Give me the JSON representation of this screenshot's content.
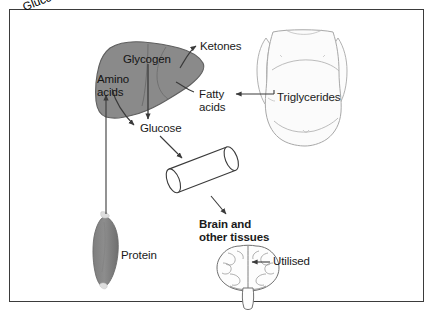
{
  "diagram": {
    "background": "#ffffff",
    "border_color": "#3b3b3b",
    "organ_fill": "#8a8a8a",
    "organ_stroke": "#5a5a5a",
    "outline_color": "#9a9a9a",
    "arrow_color": "#3a3a3a",
    "text_color": "#1a1a1a"
  },
  "labels": {
    "glycogen": "Glycogen",
    "amino_acids": "Amino\nacids",
    "ketones": "Ketones",
    "fatty_acids": "Fatty\nacids",
    "triglycerides": "Triglycerides",
    "glucose_liver": "Glucose",
    "glucose_tube": "Glucose",
    "brain_and_other_tissues": "Brain and\nother tissues",
    "utilised": "Utilised",
    "protein": "Protein"
  },
  "shapes": {
    "liver": "liver-organ",
    "torso": "human-torso-outline",
    "muscle": "skeletal-muscle",
    "cylinder": "glucose-transport-tube",
    "brain": "brain-outline"
  },
  "flows": [
    {
      "from": "Glycogen",
      "to": "Glucose",
      "type": "arrow-down"
    },
    {
      "from": "Liver",
      "to": "Ketones",
      "type": "curved-arrow"
    },
    {
      "from": "Triglycerides",
      "to": "Fatty acids",
      "type": "arrow-left"
    },
    {
      "from": "Amino acids",
      "to": "Glucose",
      "type": "curved-arrow"
    },
    {
      "from": "Protein",
      "to": "Amino acids",
      "type": "arrow-up"
    },
    {
      "from": "Glucose",
      "to": "Glucose tube",
      "type": "arrow-diagonal"
    },
    {
      "from": "Glucose tube",
      "to": "Brain and other tissues",
      "type": "arrow-diagonal"
    },
    {
      "from": "Utilised",
      "to": "Brain",
      "type": "arrow-left"
    }
  ]
}
